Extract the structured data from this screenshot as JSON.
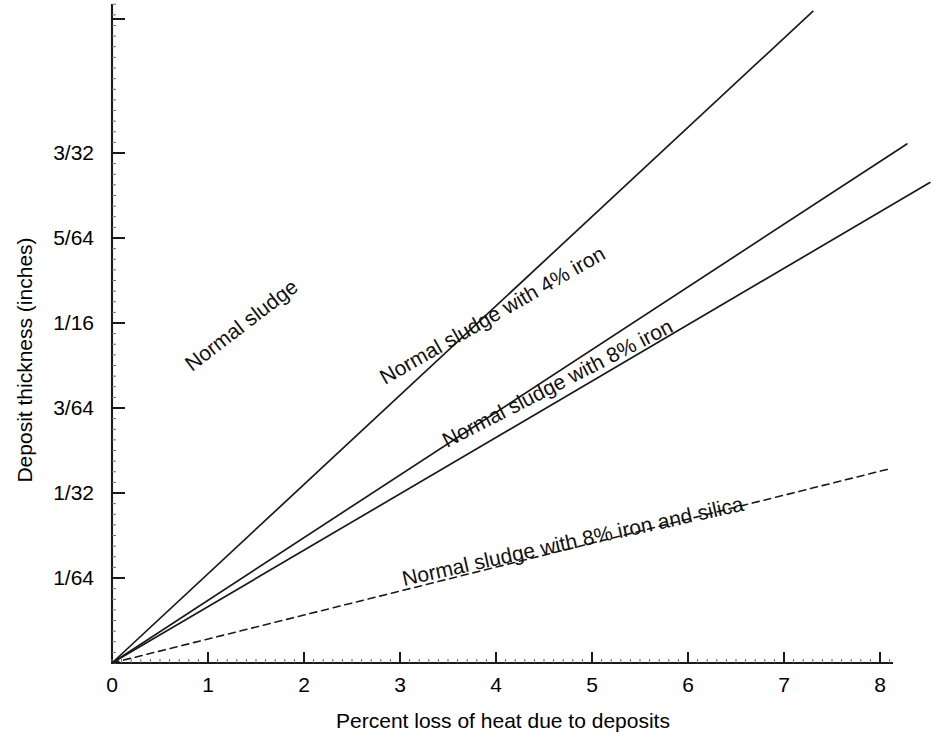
{
  "chart_data": {
    "type": "line",
    "title": "",
    "xlabel": "Percent loss of heat due to deposits",
    "ylabel": "Deposit thickness (inches)",
    "xlim": [
      0,
      8.4
    ],
    "ylim": [
      0,
      0.1095
    ],
    "grid": false,
    "legend": "inline-rotated-labels",
    "x_ticks": [
      {
        "value": 0,
        "label": "0"
      },
      {
        "value": 1,
        "label": "1"
      },
      {
        "value": 2,
        "label": "2"
      },
      {
        "value": 3,
        "label": "3"
      },
      {
        "value": 4,
        "label": "4"
      },
      {
        "value": 5,
        "label": "5"
      },
      {
        "value": 6,
        "label": "6"
      },
      {
        "value": 7,
        "label": "7"
      },
      {
        "value": 8,
        "label": "8"
      }
    ],
    "y_ticks": [
      {
        "value": 0.015625,
        "label": "1/64"
      },
      {
        "value": 0.03125,
        "label": "1/32"
      },
      {
        "value": 0.046875,
        "label": "3/64"
      },
      {
        "value": 0.0625,
        "label": "1/16"
      },
      {
        "value": 0.078125,
        "label": "5/64"
      },
      {
        "value": 0.09375,
        "label": "3/32"
      }
    ],
    "series": [
      {
        "name": "Normal sludge",
        "label": "Normal sludge",
        "style": "solid",
        "slope_in_per_percent": 0.01641,
        "x": [
          0,
          7.3
        ],
        "y": [
          0,
          0.1198
        ]
      },
      {
        "name": "Normal sludge with 4% iron",
        "label": "Normal sludge with 4% iron",
        "style": "solid",
        "slope_in_per_percent": 0.01152,
        "x": [
          0,
          8.28
        ],
        "y": [
          0,
          0.0954
        ]
      },
      {
        "name": "Normal sludge with 8% iron",
        "label": "Normal sludge with 8% iron",
        "style": "solid",
        "slope_in_per_percent": 0.01037,
        "x": [
          0,
          8.52
        ],
        "y": [
          0,
          0.0883
        ]
      },
      {
        "name": "Normal sludge with 8% iron and silica",
        "label": "Normal sludge with 8% iron and silica",
        "style": "dashed",
        "slope_in_per_percent": 0.00441,
        "x": [
          0,
          8.1
        ],
        "y": [
          0,
          0.0357
        ]
      }
    ]
  },
  "axes": {
    "x_title": "Percent loss of heat due to deposits",
    "y_title": "Deposit thickness (inches)"
  },
  "colors": {
    "ink": "#1a1a1a",
    "background": "#ffffff",
    "minor_tick": "#6f6f6f"
  }
}
